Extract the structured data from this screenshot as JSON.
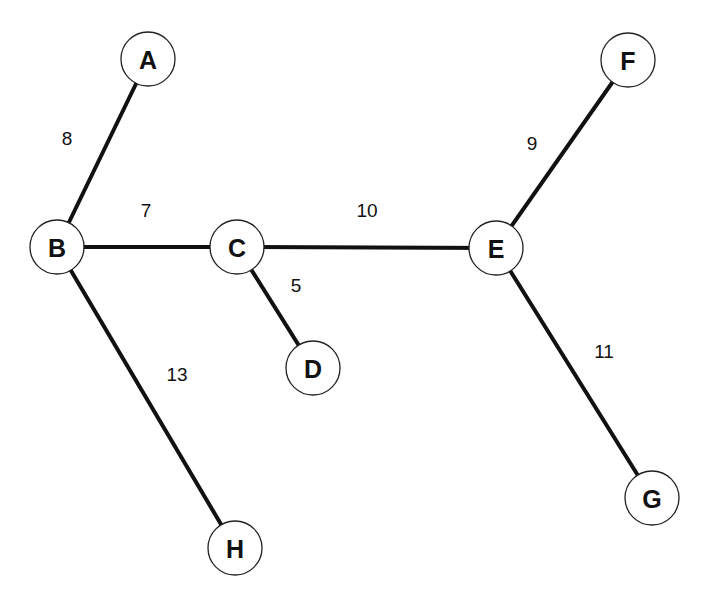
{
  "graph": {
    "type": "weighted-undirected-tree",
    "node_radius": 27,
    "colors": {
      "background": "#ffffff",
      "edge": "#111111",
      "node_fill": "#ffffff",
      "node_stroke": "#222222",
      "text": "#111111"
    },
    "nodes": [
      {
        "id": "A",
        "label": "A",
        "x": 148,
        "y": 59
      },
      {
        "id": "B",
        "label": "B",
        "x": 57,
        "y": 247
      },
      {
        "id": "C",
        "label": "C",
        "x": 237,
        "y": 247
      },
      {
        "id": "D",
        "label": "D",
        "x": 313,
        "y": 368
      },
      {
        "id": "E",
        "label": "E",
        "x": 496,
        "y": 248
      },
      {
        "id": "F",
        "label": "F",
        "x": 628,
        "y": 60
      },
      {
        "id": "G",
        "label": "G",
        "x": 652,
        "y": 498
      },
      {
        "id": "H",
        "label": "H",
        "x": 235,
        "y": 548
      }
    ],
    "edges": [
      {
        "from": "A",
        "to": "B",
        "weight": "8",
        "label_x": 67,
        "label_y": 138
      },
      {
        "from": "B",
        "to": "C",
        "weight": "7",
        "label_x": 146,
        "label_y": 210
      },
      {
        "from": "C",
        "to": "E",
        "weight": "10",
        "label_x": 367,
        "label_y": 210
      },
      {
        "from": "C",
        "to": "D",
        "weight": "5",
        "label_x": 296,
        "label_y": 285
      },
      {
        "from": "E",
        "to": "F",
        "weight": "9",
        "label_x": 532,
        "label_y": 143
      },
      {
        "from": "E",
        "to": "G",
        "weight": "11",
        "label_x": 604,
        "label_y": 351
      },
      {
        "from": "B",
        "to": "H",
        "weight": "13",
        "label_x": 177,
        "label_y": 374
      }
    ]
  }
}
